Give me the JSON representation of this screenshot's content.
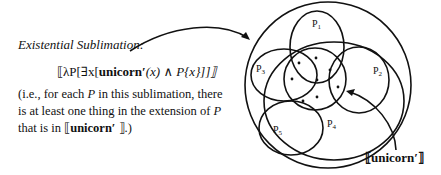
{
  "title": "Existential Sublimation",
  "title_suffix": ":",
  "formula": {
    "open": "⟦λP[∃x[",
    "predicate": "unicorn′",
    "mid": "(x) ∧ ",
    "var": "P",
    "close": "{x}]]⟧"
  },
  "explanation": {
    "p1": "(i.e., for each ",
    "var1": "P",
    "p2": " in this sublimation, there is at least one thing in the extension of ",
    "var2": "P",
    "p3": " that is in ⟦",
    "pred": "unicorn′",
    "p4": " ⟧.)"
  },
  "diagram": {
    "sets": [
      {
        "name": "P",
        "sub": "1"
      },
      {
        "name": "P",
        "sub": "2"
      },
      {
        "name": "P",
        "sub": "3"
      },
      {
        "name": "P",
        "sub": "4"
      },
      {
        "name": "P",
        "sub": "5"
      }
    ],
    "unicorn_label": "⟦unicorn′⟧"
  },
  "colors": {
    "ink": "#111111",
    "background": "#ffffff"
  }
}
